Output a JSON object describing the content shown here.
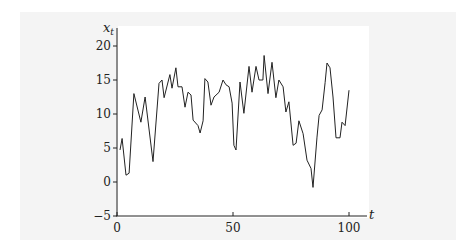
{
  "chart_data": {
    "type": "line",
    "title": "",
    "xlabel": "t",
    "ylabel": "x_t",
    "xlim": [
      0,
      100
    ],
    "ylim": [
      -5,
      20
    ],
    "xticks": [
      0,
      50,
      100
    ],
    "yticks": [
      -5,
      0,
      5,
      10,
      15,
      20
    ],
    "grid": false,
    "legend": null,
    "series": [
      {
        "name": "x_t",
        "color": "#222222",
        "points": [
          [
            1.3,
            4.7
          ],
          [
            2.2,
            6.4
          ],
          [
            3.9,
            1.0
          ],
          [
            5.2,
            1.3
          ],
          [
            7.3,
            13.0
          ],
          [
            10.3,
            8.8
          ],
          [
            12.1,
            12.5
          ],
          [
            15.5,
            3.0
          ],
          [
            18.1,
            14.5
          ],
          [
            19.4,
            15.0
          ],
          [
            20.3,
            12.4
          ],
          [
            22.8,
            15.8
          ],
          [
            23.7,
            13.8
          ],
          [
            25.4,
            16.8
          ],
          [
            26.3,
            14.0
          ],
          [
            28.0,
            14.0
          ],
          [
            29.3,
            11.0
          ],
          [
            30.6,
            13.2
          ],
          [
            31.9,
            12.8
          ],
          [
            32.8,
            9.1
          ],
          [
            34.9,
            8.3
          ],
          [
            35.8,
            7.2
          ],
          [
            37.1,
            9.0
          ],
          [
            37.9,
            15.2
          ],
          [
            39.2,
            14.7
          ],
          [
            40.5,
            11.3
          ],
          [
            41.8,
            12.5
          ],
          [
            44.0,
            13.2
          ],
          [
            45.7,
            15.0
          ],
          [
            47.0,
            14.3
          ],
          [
            48.3,
            14.0
          ],
          [
            49.6,
            11.6
          ],
          [
            50.4,
            5.4
          ],
          [
            51.3,
            4.7
          ],
          [
            53.0,
            14.7
          ],
          [
            54.7,
            10.1
          ],
          [
            56.9,
            17.0
          ],
          [
            58.2,
            13.2
          ],
          [
            59.9,
            17.0
          ],
          [
            61.2,
            15.0
          ],
          [
            62.9,
            15.0
          ],
          [
            63.4,
            18.6
          ],
          [
            65.1,
            13.0
          ],
          [
            66.8,
            17.6
          ],
          [
            68.5,
            12.4
          ],
          [
            69.8,
            15.0
          ],
          [
            71.6,
            14.0
          ],
          [
            72.8,
            10.3
          ],
          [
            74.1,
            11.8
          ],
          [
            75.9,
            5.4
          ],
          [
            77.2,
            5.7
          ],
          [
            78.4,
            9.0
          ],
          [
            80.2,
            7.1
          ],
          [
            81.9,
            3.2
          ],
          [
            83.6,
            2.0
          ],
          [
            84.5,
            -0.8
          ],
          [
            86.2,
            6.6
          ],
          [
            87.1,
            9.8
          ],
          [
            88.4,
            10.6
          ],
          [
            89.7,
            14.6
          ],
          [
            90.5,
            17.5
          ],
          [
            91.8,
            16.8
          ],
          [
            93.1,
            12.5
          ],
          [
            94.4,
            6.5
          ],
          [
            96.1,
            6.5
          ],
          [
            97.0,
            8.8
          ],
          [
            98.3,
            8.3
          ],
          [
            100.0,
            13.5
          ]
        ]
      }
    ]
  },
  "axes": {
    "x_label": "t",
    "y_label_main": "x",
    "y_label_sub": "t",
    "x_tick_labels": [
      "0",
      "50",
      "100"
    ],
    "y_tick_labels": [
      "−5",
      "0",
      "5",
      "10",
      "15",
      "20"
    ]
  }
}
